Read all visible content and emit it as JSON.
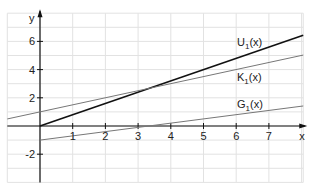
{
  "chart_data": {
    "type": "line",
    "title": "",
    "xlabel": "x",
    "ylabel": "y",
    "xlim": [
      -1,
      8.05
    ],
    "ylim": [
      -4,
      8
    ],
    "grid": true,
    "x_ticks": [
      1,
      2,
      3,
      4,
      5,
      6,
      7
    ],
    "y_ticks": [
      -2,
      2,
      4,
      6
    ],
    "series": [
      {
        "name": "U1(x)",
        "label": "U",
        "sub": "1",
        "suffix": "(x)",
        "slope": 0.8,
        "intercept": 0,
        "x": [
          0,
          8.05
        ],
        "values": [
          0,
          6.44
        ],
        "color": "#111111",
        "width": 1.6
      },
      {
        "name": "K1(x)",
        "label": "K",
        "sub": "1",
        "suffix": "(x)",
        "slope": 0.5,
        "intercept": 1,
        "x": [
          -1,
          8.05
        ],
        "values": [
          0.5,
          5.03
        ],
        "color": "#777777",
        "width": 1
      },
      {
        "name": "G1(x)",
        "label": "G",
        "sub": "1",
        "suffix": "(x)",
        "slope": 0.3,
        "intercept": -1,
        "x": [
          0,
          8.05
        ],
        "values": [
          -1,
          1.42
        ],
        "color": "#777777",
        "width": 1
      }
    ],
    "annotations": [
      {
        "text": "U1(x)",
        "x": 6.1,
        "y": 5.9
      },
      {
        "text": "K1(x)",
        "x": 6.1,
        "y": 3.5
      },
      {
        "text": "G1(x)",
        "x": 6.1,
        "y": 1.6
      }
    ]
  },
  "labels": {
    "x_axis": "x",
    "y_axis": "y",
    "curves": {
      "u": {
        "main": "U",
        "sub": "1",
        "suffix": "(x)"
      },
      "k": {
        "main": "K",
        "sub": "1",
        "suffix": "(x)"
      },
      "g": {
        "main": "G",
        "sub": "1",
        "suffix": "(x)"
      }
    }
  }
}
